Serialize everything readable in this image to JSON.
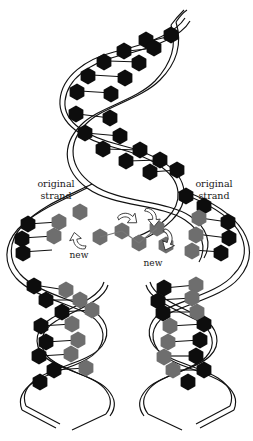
{
  "figure": {
    "background_color": "#ffffff",
    "width": 253,
    "height": 441
  },
  "labels": {
    "original_left": "original\nstrand",
    "original_right": "original\nstrand",
    "new_left": "new",
    "new_right": "new"
  },
  "colors": {
    "original_base": "#0d0d0d",
    "new_base": "#6e6e6e",
    "backbone_stroke": "#111111",
    "rung_stroke": "#111111",
    "arrow_fill": "#ffffff",
    "arrow_stroke": "#333333",
    "background": "#ffffff",
    "text": "#1a1a1a"
  },
  "structure": {
    "parent_helix": {
      "name": "parent-double-helix",
      "position": "top",
      "base_color": "original_base",
      "turns": 2.5
    },
    "replication_fork": {
      "name": "replication-fork",
      "position": "middle",
      "free_nucleotide_count": 6,
      "arrow_count": 4
    },
    "daughter_helices": [
      {
        "name": "daughter-helix-left",
        "original_strand": "left",
        "new_strand": "right"
      },
      {
        "name": "daughter-helix-right",
        "original_strand": "left",
        "new_strand": "right"
      }
    ]
  },
  "icons": {
    "hexagon_base": "hexagon-nucleotide-icon",
    "curved_arrow": "curved-arrow-icon"
  }
}
